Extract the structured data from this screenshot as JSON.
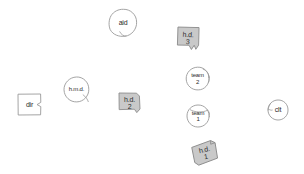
{
  "diagram": {
    "background_color": "#ffffff",
    "stroke_color": "#9a9a9a",
    "text_color": "#2b2b2b",
    "box_fill_color": "#c9c9c9",
    "circle_fill_color": "#ffffff",
    "nodes": [
      {
        "id": "aid",
        "shape": "circle",
        "label": "aid",
        "sublabel": "",
        "x": 108,
        "y": 8,
        "w": 30,
        "h": 30,
        "rotation": 0,
        "fill": "#ffffff"
      },
      {
        "id": "hd3",
        "shape": "box",
        "label": "h.d.",
        "sublabel": "3",
        "x": 176,
        "y": 26,
        "w": 24,
        "h": 24,
        "rotation": 3,
        "fill": "#c9c9c9"
      },
      {
        "id": "team2",
        "shape": "circle",
        "label": "team",
        "sublabel": "2",
        "x": 185,
        "y": 66,
        "w": 25,
        "h": 25,
        "rotation": 0,
        "fill": "#ffffff"
      },
      {
        "id": "hmd",
        "shape": "circle",
        "label": "h.m.d.",
        "sublabel": "",
        "x": 63,
        "y": 76,
        "w": 27,
        "h": 27,
        "rotation": 0,
        "fill": "#ffffff"
      },
      {
        "id": "dir",
        "shape": "box",
        "label": "dir",
        "sublabel": "",
        "x": 17,
        "y": 93,
        "w": 25,
        "h": 23,
        "rotation": 0,
        "fill": "#ffffff"
      },
      {
        "id": "hd2",
        "shape": "box",
        "label": "h.d.",
        "sublabel": "2",
        "x": 118,
        "y": 92,
        "w": 23,
        "h": 22,
        "rotation": 0,
        "fill": "#c9c9c9"
      },
      {
        "id": "team1",
        "shape": "circle",
        "label": "team",
        "sublabel": "1",
        "x": 186,
        "y": 104,
        "w": 24,
        "h": 24,
        "rotation": 0,
        "fill": "#ffffff"
      },
      {
        "id": "clt",
        "shape": "circle",
        "label": "clt",
        "sublabel": "",
        "x": 267,
        "y": 99,
        "w": 22,
        "h": 22,
        "rotation": 0,
        "fill": "#ffffff"
      },
      {
        "id": "hd1",
        "shape": "box",
        "label": "h.d.",
        "sublabel": "1",
        "x": 192,
        "y": 141,
        "w": 26,
        "h": 24,
        "rotation": -12,
        "fill": "#c9c9c9"
      }
    ]
  }
}
